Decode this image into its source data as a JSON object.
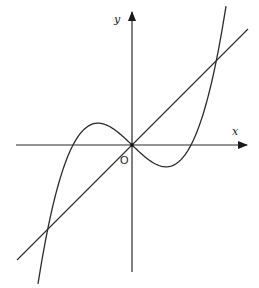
{
  "diagram": {
    "type": "function-graph",
    "axes": {
      "x_label": "x",
      "y_label": "y",
      "origin_label": "O"
    },
    "curve": {
      "kind": "cubic",
      "form": "y = k*x*(x^2 - r^2)",
      "roots_px_offset": 59,
      "k_px": 0.000276
    },
    "line": {
      "kind": "linear",
      "form": "y = x",
      "slope": 1,
      "through_origin": true
    },
    "colors": {
      "stroke": "#2a2a2a",
      "background": "#ffffff"
    }
  }
}
